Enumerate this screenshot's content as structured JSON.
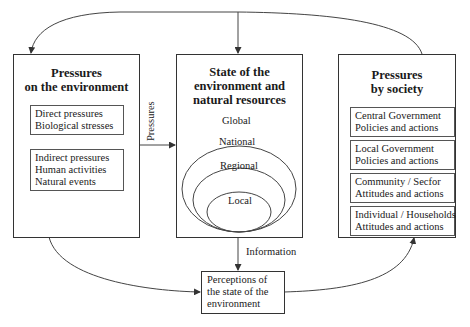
{
  "diagram": {
    "left_box": {
      "title_line1": "Pressures",
      "title_line2": "on the environment",
      "direct": [
        "Direct pressures",
        "Biological stresses"
      ],
      "indirect": [
        "Indirect pressures",
        "Human activities",
        "Natural events"
      ]
    },
    "center_box": {
      "title_line1": "State of the",
      "title_line2": "environment and",
      "title_line3": "natural resources",
      "scales": [
        "Global",
        "National",
        "Regional",
        "Local"
      ]
    },
    "right_box": {
      "title_line1": "Pressures",
      "title_line2": "by society",
      "items": [
        [
          "Central Government",
          "Policies and actions"
        ],
        [
          "Local Government",
          "Policies and actions"
        ],
        [
          "Community / Secfor",
          "Attitudes and actions"
        ],
        [
          "Individual / Households",
          "Attitudes and actions"
        ]
      ]
    },
    "bottom_box": [
      "Perceptions of",
      "the state of the",
      "environment"
    ],
    "arrow_labels": {
      "pressures": "Pressures",
      "information": "Information"
    },
    "colors": {
      "line": "#333333",
      "background": "#ffffff"
    }
  }
}
